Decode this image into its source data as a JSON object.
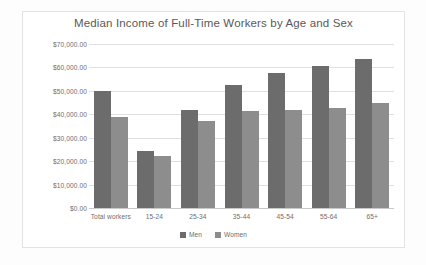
{
  "chart_data": {
    "type": "bar",
    "title": "Median Income of Full-Time Workers by Age and Sex",
    "xlabel": "",
    "ylabel": "",
    "ylim": [
      0,
      70000
    ],
    "ytick_labels": [
      "$70,000.00",
      "$60,000.00",
      "$50,000.00",
      "$40,000.00",
      "$30,000.00",
      "$20,000.00",
      "$10,000.00",
      "$0.00"
    ],
    "ytick_values": [
      70000,
      60000,
      50000,
      40000,
      30000,
      20000,
      10000,
      0
    ],
    "grid": true,
    "legend_position": "bottom",
    "categories": [
      "Total workers",
      "15-24",
      "25-34",
      "35-44",
      "45-54",
      "55-64",
      "65+"
    ],
    "series": [
      {
        "name": "Men",
        "color": "#6c6c6c",
        "values": [
          50000,
          24500,
          42000,
          52500,
          57500,
          60500,
          63500
        ]
      },
      {
        "name": "Women",
        "color": "#8d8d8d",
        "values": [
          38800,
          22000,
          37000,
          41500,
          42000,
          42500,
          44800
        ]
      }
    ]
  },
  "colors": {
    "men": "#6c6c6c",
    "women": "#8d8d8d",
    "gridline": "#e0e0e0",
    "text": "#6d6d6f",
    "title_text": "#59595b",
    "panel_background": "#ffffff",
    "page_background": "#fdfdfd",
    "panel_border": "#e3e3e3"
  }
}
